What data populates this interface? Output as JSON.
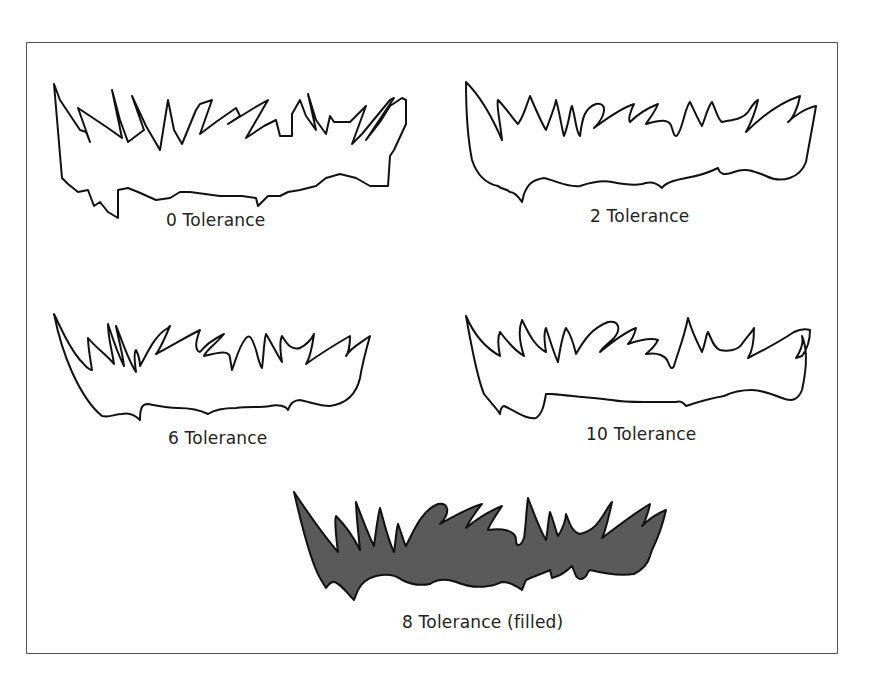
{
  "figure": {
    "frame": {
      "border_color": "#555555"
    },
    "panels": [
      {
        "id": "tol-0",
        "label": "0 Tolerance",
        "filled": false
      },
      {
        "id": "tol-2",
        "label": "2 Tolerance",
        "filled": false
      },
      {
        "id": "tol-6",
        "label": "6 Tolerance",
        "filled": false
      },
      {
        "id": "tol-10",
        "label": "10 Tolerance",
        "filled": false
      },
      {
        "id": "tol-8-filled",
        "label": "8 Tolerance (filled)",
        "filled": true,
        "fill_color": "#5a5a5a"
      }
    ],
    "stroke_color": "#111111"
  }
}
